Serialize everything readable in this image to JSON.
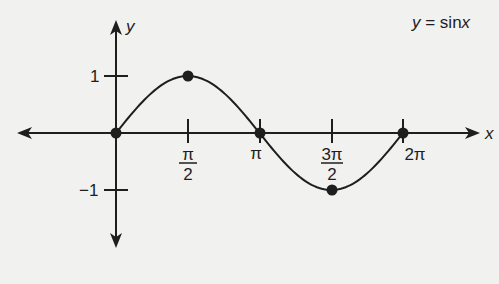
{
  "chart_data": {
    "type": "line",
    "title": "y = sinx",
    "xlabel": "x",
    "ylabel": "y",
    "x_ticks": [
      {
        "value": 1.5708,
        "label": "π/2",
        "num": "π",
        "den": "2"
      },
      {
        "value": 3.1416,
        "label": "π"
      },
      {
        "value": 4.7124,
        "label": "3π/2",
        "num": "3π",
        "den": "2"
      },
      {
        "value": 6.2832,
        "label": "2π"
      }
    ],
    "y_ticks": [
      {
        "value": 1,
        "label": "1"
      },
      {
        "value": -1,
        "label": "−1"
      }
    ],
    "series": [
      {
        "name": "y = sinx",
        "x_range": [
          0,
          6.2832
        ],
        "marked_points": [
          {
            "x": 0,
            "y": 0,
            "label": "(0, 0)"
          },
          {
            "x": 1.5708,
            "y": 1,
            "label": "(π/2, 1)"
          },
          {
            "x": 3.1416,
            "y": 0,
            "label": "(π, 0)"
          },
          {
            "x": 4.7124,
            "y": -1,
            "label": "(3π/2, −1)"
          },
          {
            "x": 6.2832,
            "y": 0,
            "label": "(2π, 0)"
          }
        ]
      }
    ],
    "xlim": [
      -2.2,
      8.2
    ],
    "ylim": [
      -2.0,
      2.0
    ],
    "grid": false,
    "legend": "none",
    "colors": {
      "line": "#1e1e1e",
      "background": "#f1f1ef"
    }
  },
  "labels": {
    "equation_y": "y",
    "equation_rest": " = sin",
    "equation_x": "x",
    "x_axis": "x",
    "y_axis": "y",
    "y_one": "1",
    "y_minus_one": "−1",
    "pi_half_num": "π",
    "pi_half_den": "2",
    "pi": "π",
    "three_pi_half_num": "3π",
    "three_pi_half_den": "2",
    "two_pi": "2π"
  }
}
